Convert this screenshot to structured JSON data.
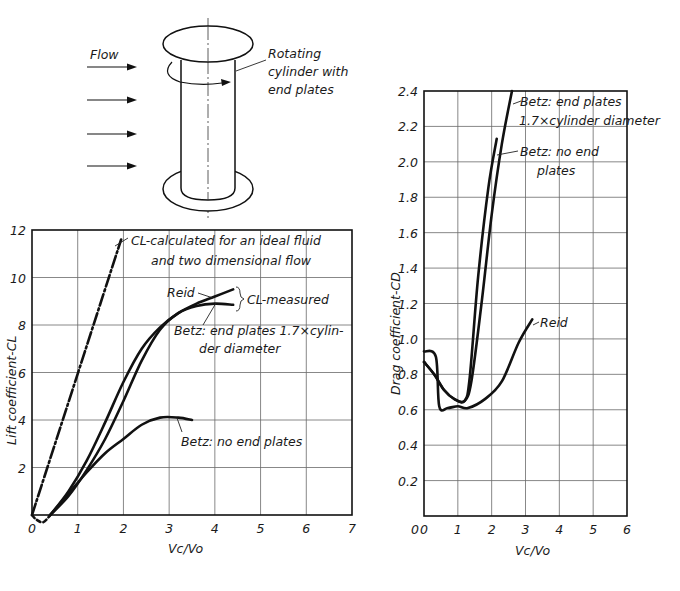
{
  "diagram": {
    "flow_label": "Flow",
    "cylinder_label_lines": [
      "Rotating",
      "cylinder with",
      "end plates"
    ],
    "flow_arrows": 4
  },
  "chart_data": [
    {
      "type": "line",
      "id": "lift",
      "title": "",
      "xlabel": "Vc/Vo",
      "ylabel": "Lift coefficient-CL",
      "xlim": [
        0,
        7
      ],
      "ylim": [
        0,
        12
      ],
      "xticks": [
        "0",
        "1",
        "2",
        "3",
        "4",
        "5",
        "6",
        "7"
      ],
      "yticks": [
        "0",
        "2",
        "4",
        "6",
        "8",
        "10",
        "12"
      ],
      "grid": true,
      "legend_position": "annotations",
      "series": [
        {
          "name": "CL-calculated for an ideal fluid and two dimensional flow",
          "style": "dash-dot",
          "x": [
            0,
            1.95
          ],
          "y": [
            0,
            11.6
          ]
        },
        {
          "name": "Reid",
          "style": "solid",
          "x": [
            0.4,
            0.8,
            1.2,
            1.6,
            2.0,
            2.4,
            2.8,
            3.2,
            3.6,
            4.0,
            4.4
          ],
          "y": [
            0,
            1.0,
            2.3,
            3.9,
            5.6,
            7.0,
            7.9,
            8.5,
            8.9,
            9.2,
            9.5
          ]
        },
        {
          "name": "Betz: end plates 1.7×cylinder diameter",
          "style": "solid",
          "x": [
            0.4,
            0.8,
            1.2,
            1.6,
            2.0,
            2.4,
            2.8,
            3.2,
            3.6,
            4.0,
            4.4
          ],
          "y": [
            0,
            0.8,
            1.9,
            3.2,
            4.8,
            6.5,
            7.8,
            8.5,
            8.8,
            8.9,
            8.85
          ]
        },
        {
          "name": "Betz: no end plates",
          "style": "solid",
          "x": [
            0.4,
            0.8,
            1.2,
            1.6,
            2.0,
            2.4,
            2.8,
            3.2,
            3.5
          ],
          "y": [
            0,
            0.9,
            1.8,
            2.6,
            3.2,
            3.8,
            4.1,
            4.1,
            4.0
          ]
        },
        {
          "name": "initial dip (dashed)",
          "style": "dashed",
          "x": [
            0,
            0.1,
            0.25,
            0.4
          ],
          "y": [
            0,
            -0.2,
            -0.3,
            0
          ]
        }
      ],
      "annotations": [
        {
          "text": "CL-calculated for an ideal fluid",
          "line": 1
        },
        {
          "text": "and two dimensional flow",
          "line": 2
        },
        {
          "text": "Reid"
        },
        {
          "text": "CL-measured"
        },
        {
          "text": "Betz: end plates 1.7×cylin-"
        },
        {
          "text": "der diameter"
        },
        {
          "text": "Betz: no end plates"
        }
      ]
    },
    {
      "type": "line",
      "id": "drag",
      "title": "",
      "xlabel": "Vc/Vo",
      "ylabel": "Drag coefficient-CD",
      "xlim": [
        0,
        6
      ],
      "ylim": [
        0,
        2.4
      ],
      "xticks": [
        "0",
        "1",
        "2",
        "3",
        "4",
        "5",
        "6"
      ],
      "yticks": [
        "0.2",
        "0.4",
        "0.6",
        "0.8",
        "1.0",
        "1.2",
        "1.4",
        "1.6",
        "1.8",
        "2.0",
        "2.2",
        "2.4"
      ],
      "grid": true,
      "legend_position": "annotations",
      "series": [
        {
          "name": "Betz: end plates 1.7×cylinder diameter",
          "style": "solid",
          "x": [
            0,
            0.3,
            0.6,
            0.9,
            1.2,
            1.4,
            1.7,
            2.0,
            2.3,
            2.6
          ],
          "y": [
            0.87,
            0.8,
            0.71,
            0.66,
            0.65,
            0.76,
            1.2,
            1.7,
            2.1,
            2.4
          ]
        },
        {
          "name": "Betz: no end plates",
          "style": "solid",
          "x": [
            0,
            0.3,
            0.6,
            0.9,
            1.2,
            1.35,
            1.6,
            1.9,
            2.15
          ],
          "y": [
            0.87,
            0.8,
            0.71,
            0.66,
            0.65,
            0.78,
            1.35,
            1.85,
            2.13
          ]
        },
        {
          "name": "Reid",
          "style": "solid",
          "x": [
            0,
            0.35,
            0.45,
            0.7,
            1.0,
            1.3,
            1.8,
            2.3,
            2.8,
            3.2
          ],
          "y": [
            0.93,
            0.9,
            0.62,
            0.61,
            0.62,
            0.61,
            0.66,
            0.76,
            0.98,
            1.11
          ]
        }
      ],
      "annotations": [
        {
          "text": "Betz: end plates"
        },
        {
          "text": "1.7×cylinder diameter"
        },
        {
          "text": "Betz: no end"
        },
        {
          "text": "plates"
        },
        {
          "text": "Reid"
        }
      ]
    }
  ],
  "labels": {
    "lift_ann_ideal_1": "CL-calculated for an ideal fluid",
    "lift_ann_ideal_2": "and two dimensional flow",
    "lift_ann_reid": "Reid",
    "lift_ann_measured": "CL-measured",
    "lift_ann_betz_ep_1": "Betz: end plates 1.7×cylin-",
    "lift_ann_betz_ep_2": "der diameter",
    "lift_ann_betz_nep": "Betz: no end plates",
    "lift_ylabel": "Lift coefficient-CL",
    "lift_xlabel": "Vc/Vo",
    "drag_ann_betz_ep_1": "Betz: end plates",
    "drag_ann_betz_ep_2": "1.7×cylinder diameter",
    "drag_ann_betz_nep_1": "Betz: no end",
    "drag_ann_betz_nep_2": "plates",
    "drag_ann_reid": "Reid",
    "drag_ylabel": "Drag coefficient-CD",
    "drag_xlabel": "Vc/Vo"
  }
}
